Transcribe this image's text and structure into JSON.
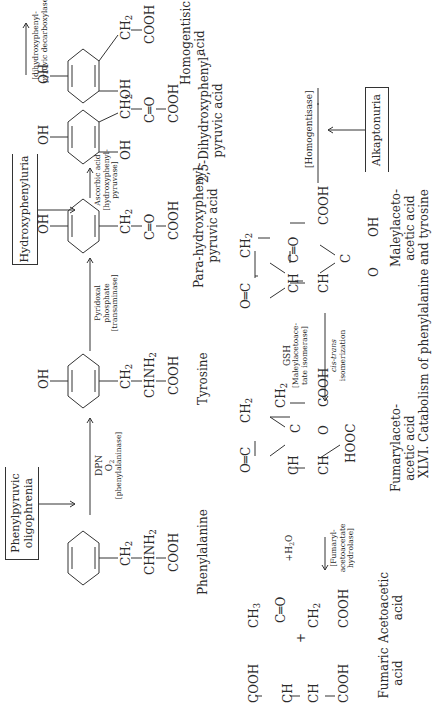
{
  "figure": {
    "caption": "XLVI. Catabolism of phenylalanine and tyrosine"
  },
  "disorders": {
    "phenylpyruvic": [
      "Phenylpyruvic",
      "oligophrenia"
    ],
    "hydroxyphenyluria": "Hydroxyphenyluria",
    "alkaptonuria": "Alkaptonuria"
  },
  "compounds": {
    "phenylalanine": {
      "name": "Phenylalanine",
      "chain": [
        "CH2",
        "CHNH2",
        "COOH"
      ]
    },
    "tyrosine": {
      "name": "Tyrosine",
      "ring_sub": "OH",
      "chain": [
        "CH2",
        "CHNH2",
        "COOH"
      ]
    },
    "para_hydroxyphenylpyruvic": {
      "name": [
        "Para-hydroxyphenyl-",
        "pyruvic acid"
      ],
      "ring_sub": "OH",
      "chain": [
        "CH2",
        "C=O",
        "COOH"
      ]
    },
    "dihydroxyphenylpyruvic": {
      "name": [
        "2,5-Dihydroxyphenyl-",
        "pyruvic acid"
      ],
      "ring_sub": [
        "OH",
        "OH"
      ],
      "chain": [
        "CH2",
        "C=O",
        "COOH"
      ]
    },
    "homogentisic": {
      "name": [
        "Homogentisic",
        "acid"
      ],
      "ring_sub": [
        "OH",
        "OH"
      ],
      "chain": [
        "CH2",
        "COOH"
      ]
    },
    "maleylacetoacetic": {
      "name": [
        "Maleylaceto-",
        "acetic acid"
      ],
      "atoms": [
        "O=C",
        "CH2",
        "C=O",
        "COOH",
        "CH",
        "CH",
        "C",
        "O",
        "OH"
      ]
    },
    "fumarylacetoacetic": {
      "name": [
        "Fumarylaceto-",
        "acetic acid"
      ],
      "atoms": [
        "O=C",
        "CH2",
        "C",
        "O",
        "CH2",
        "COOH",
        "CH",
        "CH",
        "HOOC"
      ]
    },
    "fumaric": {
      "name": [
        "Fumaric",
        "acid"
      ],
      "atoms": [
        "COOH",
        "CH",
        "CH",
        "COOH"
      ]
    },
    "acetoacetic": {
      "name": [
        "Acetoacetic",
        "acid"
      ],
      "atoms": [
        "CH3",
        "C=O",
        "CH2",
        "COOH"
      ]
    },
    "plus": "+"
  },
  "reactions": {
    "phenylalanine_hydroxylase": [
      "DPN",
      "O2",
      "[phenylalaninase]"
    ],
    "transaminase": [
      "Pyridoxal",
      "phosphate",
      "[transaminase]"
    ],
    "hydroxyphenylpyruvase": [
      "Ascorbic acid",
      "[hydroxyphenyl-",
      "pyruvase]"
    ],
    "decarboxylase": [
      "[dihydroxyphenyl-",
      "pyruvic decarboxylase]"
    ],
    "homogentisase": "[Homogentisase]",
    "isomerase": [
      "GSH",
      "[Maleylacetoace-",
      "tate isomerase]"
    ],
    "isomerization": [
      "cis-trans",
      "isomerization"
    ],
    "hydrolase": [
      "+H2O",
      "[Fumaryl-",
      "acetoacetate",
      "hydrolase]"
    ]
  }
}
